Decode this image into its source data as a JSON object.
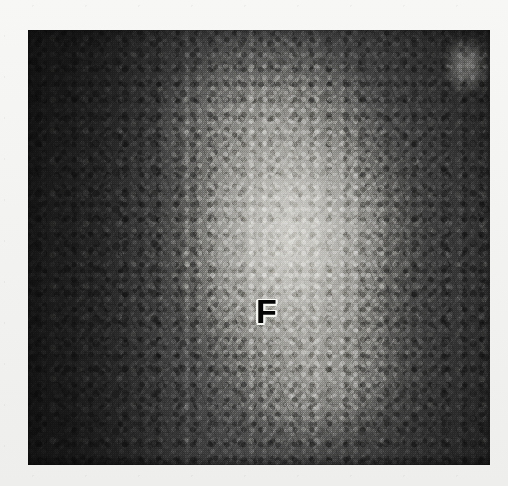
{
  "figure": {
    "kind": "histology-micrograph",
    "modality": "light-microscopy",
    "staining": "grayscale-halftone-print",
    "background_color": "#f4f4f2",
    "plate": {
      "left": 28,
      "top": 30,
      "width": 462,
      "height": 435,
      "dark_tone": "#1e1e1e",
      "mid_tone": "#585858",
      "light_tone": "#d6d5d0"
    },
    "annotations": [
      {
        "id": "follicle-label",
        "text": "F",
        "meaning": "lymphoid follicle",
        "x": 237,
        "y": 283,
        "color": "#0a0a0a",
        "halo_color": "#f2f2ef",
        "font_size_px": 34,
        "bold": true
      }
    ],
    "regions": [
      {
        "name": "lymphoid-follicle",
        "description": "large pale oval follicle occupying the centre and centre-right of the field",
        "center_x_pct": 57,
        "center_y_pct": 48,
        "radius_x_px": 150,
        "radius_y_px": 195,
        "tone": "light"
      },
      {
        "name": "dark-cortex-band",
        "description": "densely cellular dark tissue forming a vertical band along the left edge",
        "tone": "dark"
      },
      {
        "name": "peripheral-dark-tissue",
        "description": "dark densely packed lymphocytes ringing the follicle at top, right and bottom",
        "tone": "dark"
      },
      {
        "name": "pale-sinus-top-right",
        "description": "small bright sinus-like area near the upper right corner",
        "center_x_pct": 95,
        "center_y_pct": 8,
        "tone": "very-light"
      }
    ]
  }
}
